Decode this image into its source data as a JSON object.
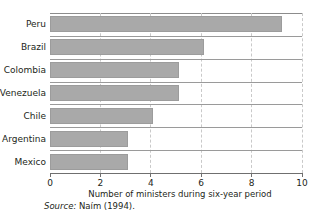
{
  "chart_data": {
    "type": "bar",
    "orientation": "horizontal",
    "title": "",
    "subtitle": "",
    "xlabel": "Number of ministers during six-year period",
    "ylabel": "",
    "categories": [
      "Peru",
      "Brazil",
      "Colombia",
      "Venezuela",
      "Chile",
      "Argentina",
      "Mexico"
    ],
    "values": [
      9.2,
      6.1,
      5.1,
      5.1,
      4.1,
      3.1,
      3.1
    ],
    "xlim": [
      0,
      10
    ],
    "xticks": [
      0,
      2,
      4,
      6,
      8,
      10
    ],
    "xtick_labels": [
      "0",
      "2",
      "4",
      "6",
      "8",
      "10"
    ],
    "grid": true,
    "grid_axis": "x",
    "legend": null,
    "bar_color": "#a9a9a9",
    "bar_edge_color": "#9c9c9c",
    "grid_color": "#c9c9c9",
    "axis_color": "#6f6f6f",
    "text_color": "#231f20",
    "background": "#ffffff"
  },
  "source_note": {
    "label": "Source:",
    "text": " Naím (1994)."
  }
}
